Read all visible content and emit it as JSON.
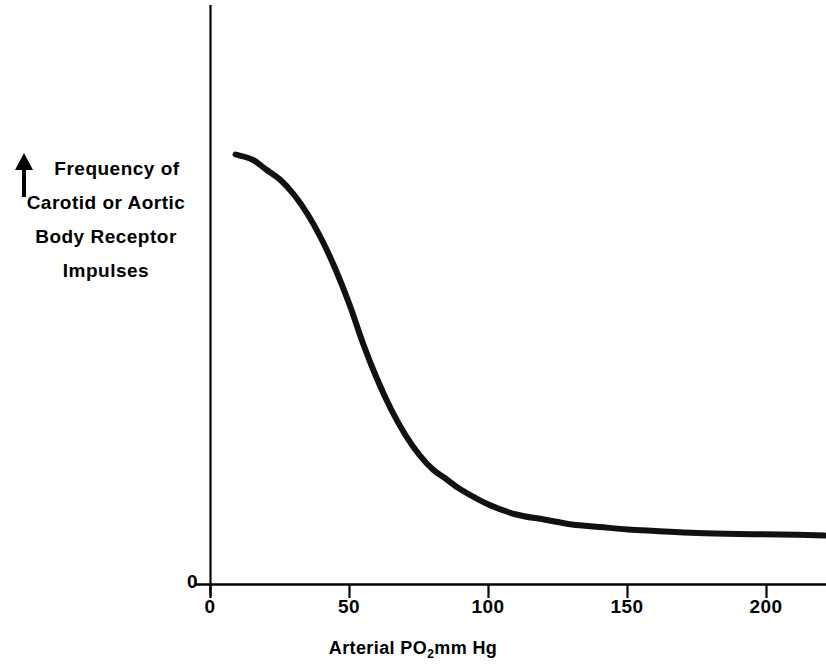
{
  "figure": {
    "background_color": "#ffffff",
    "ink_color": "#000000"
  },
  "axes": {
    "y_axis": {
      "label_lines": [
        "Frequency of",
        "Carotid or Aortic",
        "Body Receptor",
        "Impulses"
      ],
      "arrow_icon": "up-arrow-icon",
      "zero_tick_label": "0",
      "tick_labels": [
        "0"
      ]
    },
    "x_axis": {
      "title_prefix": "Arterial PO",
      "title_subscript": "2",
      "title_suffix": "mm Hg",
      "title_plain": "Arterial PO2mm Hg",
      "tick_labels": [
        "0",
        "50",
        "100",
        "150",
        "200"
      ],
      "tick_values": [
        0,
        50,
        100,
        150,
        200
      ]
    }
  },
  "chart_data": {
    "type": "line",
    "title": "",
    "subtitle": "",
    "xlabel": "Arterial PO2mm Hg",
    "ylabel": "Frequency of Carotid or Aortic Body Receptor Impulses",
    "xlim": [
      0,
      226
    ],
    "ylim": [
      0,
      100
    ],
    "xticks": [
      0,
      50,
      100,
      150,
      200
    ],
    "xticklabels": [
      "0",
      "50",
      "100",
      "150",
      "200"
    ],
    "yticks": [
      0
    ],
    "yticklabels": [
      "0"
    ],
    "grid": false,
    "legend": null,
    "line_color": "#111111",
    "line_width": 6,
    "series": [
      {
        "name": "Chemoreceptor impulse frequency",
        "x": [
          9,
          15,
          20,
          25,
          30,
          35,
          40,
          45,
          50,
          55,
          60,
          65,
          70,
          75,
          80,
          85,
          90,
          100,
          110,
          120,
          130,
          140,
          150,
          160,
          175,
          190,
          205,
          221
        ],
        "y": [
          86,
          85,
          83,
          81,
          78,
          74,
          69,
          63,
          56,
          48,
          41,
          35,
          30,
          26,
          23,
          21,
          19,
          16,
          14,
          13,
          12,
          11.5,
          11,
          10.7,
          10.3,
          10.1,
          10,
          9.8
        ]
      }
    ],
    "annotations": []
  }
}
